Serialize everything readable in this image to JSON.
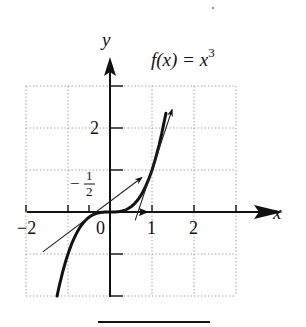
{
  "chart_data": {
    "type": "line",
    "title_parts": {
      "lhs": "f(x) = x",
      "exp": "3"
    },
    "xlabel": "x",
    "ylabel": "y",
    "xlim": [
      -2,
      3
    ],
    "ylim": [
      -2,
      3
    ],
    "grid": true,
    "grid_style": "dotted",
    "x_ticks": [
      -2,
      -1,
      0,
      1,
      2,
      3
    ],
    "x_tick_labels": [
      {
        "value": -2,
        "text": "−2"
      },
      {
        "value": 0,
        "text": "0"
      },
      {
        "value": 1,
        "text": "1"
      },
      {
        "value": 2,
        "text": "2"
      }
    ],
    "y_ticks": [
      -2,
      -1,
      1,
      2,
      3
    ],
    "y_tick_labels": [
      {
        "value": 2,
        "text": "2"
      }
    ],
    "annotations": [
      {
        "text": "−1/2",
        "num": "1",
        "den": "2",
        "sign": "−",
        "near_x": -0.5,
        "near_y": 0.6
      }
    ],
    "series": [
      {
        "name": "f(x) = x³",
        "function": "x^3",
        "x_range": [
          -1.26,
          1.33
        ],
        "style": "thick"
      },
      {
        "name": "tangent at x = −1/2",
        "function": "0.75x + 0.25",
        "x_range": [
          -1.6,
          0.76
        ],
        "style": "thin arrow"
      },
      {
        "name": "tangent at x = 0",
        "function": "0",
        "x_range": [
          0,
          0.9
        ],
        "style": "arrow on axis"
      },
      {
        "name": "tangent at x = 1",
        "function": "3x - 2",
        "x_range": [
          0.6,
          1.48
        ],
        "style": "thin arrow"
      }
    ]
  }
}
